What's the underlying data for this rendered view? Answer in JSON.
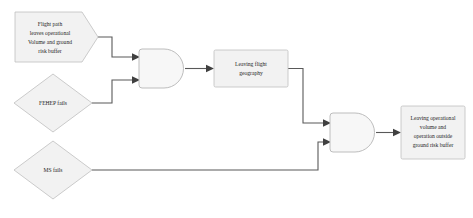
{
  "diagram": {
    "type": "fault-tree",
    "title": "",
    "colors": {
      "shape_fill": "#f2f2f2",
      "shape_stroke": "#bfbfbf",
      "gate_fill": "#f7f7f7",
      "gate_stroke": "#b5b5b5",
      "connector": "#595959",
      "text": "#262626",
      "background": "#ffffff"
    },
    "nodes": [
      {
        "id": "flight-path-leaves-operational-volume",
        "shape": "pentagon-right",
        "lines": [
          "Flight path",
          "leaves operational",
          "Volume and ground",
          "risk buffer"
        ]
      },
      {
        "id": "fehep-fails",
        "shape": "diamond",
        "lines": [
          "FEHEP fails"
        ]
      },
      {
        "id": "ms-fails",
        "shape": "diamond",
        "lines": [
          "MS fails"
        ]
      },
      {
        "id": "and-gate-1",
        "shape": "and-gate",
        "lines": []
      },
      {
        "id": "leaving-flight-geography",
        "shape": "rectangle",
        "lines": [
          "Leaving flight",
          "geography"
        ]
      },
      {
        "id": "and-gate-2",
        "shape": "and-gate",
        "lines": []
      },
      {
        "id": "leaving-operational-volume-outside-ground-risk-buffer",
        "shape": "rectangle",
        "lines": [
          "Leaving operational",
          "volume and",
          "operation outside",
          "ground risk buffer"
        ]
      }
    ],
    "edges": [
      {
        "id": "edge-flightpath-to-gate1",
        "from": "flight-path-leaves-operational-volume",
        "to": "and-gate-1"
      },
      {
        "id": "edge-fehep-to-gate1",
        "from": "fehep-fails",
        "to": "and-gate-1"
      },
      {
        "id": "edge-gate1-to-flightgeography",
        "from": "and-gate-1",
        "to": "leaving-flight-geography"
      },
      {
        "id": "edge-flightgeography-to-gate2",
        "from": "leaving-flight-geography",
        "to": "and-gate-2"
      },
      {
        "id": "edge-msfails-to-gate2",
        "from": "ms-fails",
        "to": "and-gate-2"
      },
      {
        "id": "edge-gate2-to-outcome",
        "from": "and-gate-2",
        "to": "leaving-operational-volume-outside-ground-risk-buffer"
      }
    ]
  }
}
